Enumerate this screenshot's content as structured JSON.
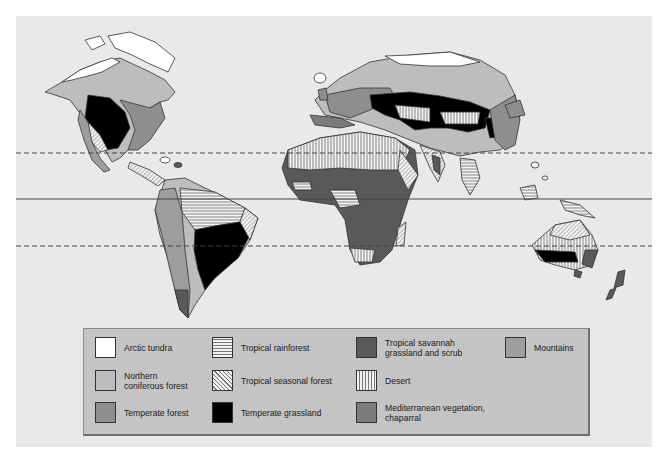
{
  "map": {
    "type": "World biome map",
    "lines": [
      {
        "name": "tropic-of-cancer",
        "style": "dashed",
        "y": 153
      },
      {
        "name": "equator",
        "style": "solid",
        "y": 199
      },
      {
        "name": "tropic-of-capricorn",
        "style": "dashed",
        "y": 246
      }
    ]
  },
  "legend": {
    "items": [
      {
        "label": "Arctic tundra",
        "fill": "#ffffff",
        "pattern": "none"
      },
      {
        "label": "Northern\nconiferous forest",
        "fill": "#bdbdbd",
        "pattern": "none"
      },
      {
        "label": "Temperate forest",
        "fill": "#8e8e8e",
        "pattern": "none"
      },
      {
        "label": "Tropical rainforest",
        "fill": "#f2f2f2",
        "pattern": "horizontal-lines"
      },
      {
        "label": "Tropical seasonal forest",
        "fill": "#f2f2f2",
        "pattern": "diagonal-lines"
      },
      {
        "label": "Temperate grassland",
        "fill": "#000000",
        "pattern": "none"
      },
      {
        "label": "Tropical savannah\ngrassland and scrub",
        "fill": "#595959",
        "pattern": "none"
      },
      {
        "label": "Desert",
        "fill": "#f2f2f2",
        "pattern": "vertical-lines"
      },
      {
        "label": "Mediterranean vegetation,\nchaparral",
        "fill": "#7c7c7c",
        "pattern": "none"
      },
      {
        "label": "Mountains",
        "fill": "#9d9d9d",
        "pattern": "none"
      }
    ]
  },
  "colors": {
    "background": "#e9e9e9",
    "legend_bg": "#c4c4c4",
    "outline": "#333333"
  }
}
